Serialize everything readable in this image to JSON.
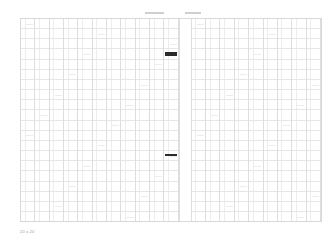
{
  "document": {
    "title": "",
    "background_color": "#ffffff",
    "grid_line_color": "#dedede",
    "grid_border_color": "#d8d8d8",
    "marker_color": "#2b2b2b",
    "text_color": "#9a9a9a"
  },
  "header": {
    "labels": [
      {
        "text": "",
        "name": "header-label-left"
      },
      {
        "text": "",
        "name": "header-label-right"
      }
    ]
  },
  "grid": {
    "column_group_count": 20,
    "row_count": 20,
    "gutter_after_group_index": 10,
    "sub_columns": [
      "label",
      "value"
    ],
    "cells": []
  },
  "markers": [
    {
      "name": "selection-marker-primary",
      "row": 3,
      "column_group": 10
    },
    {
      "name": "selection-marker-secondary",
      "row": 13,
      "column_group": 10
    }
  ],
  "footer": {
    "dimensions_label": "20 x 20"
  }
}
